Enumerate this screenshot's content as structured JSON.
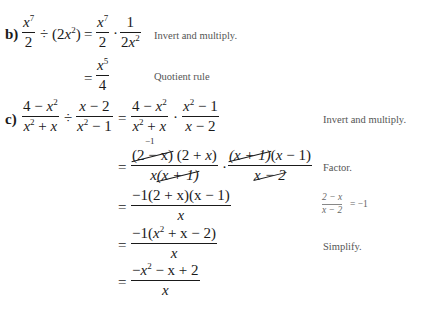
{
  "part_b": {
    "label": "b)",
    "line1": {
      "lhs_frac": {
        "num": "x",
        "num_exp": "7",
        "den": "2"
      },
      "divide_op": "÷",
      "divisor": {
        "open": "(2",
        "var": "x",
        "exp": "2",
        "close": ")"
      },
      "equals": "=",
      "rhs_frac1": {
        "num": "x",
        "num_exp": "7",
        "den": "2"
      },
      "dot": "·",
      "rhs_frac2": {
        "num": "1",
        "den_coef": "2",
        "den_var": "x",
        "den_exp": "2"
      },
      "note": "Invert and multiply."
    },
    "line2": {
      "equals": "=",
      "frac": {
        "num": "x",
        "num_exp": "5",
        "den": "4"
      },
      "note": "Quotient rule"
    }
  },
  "part_c": {
    "label": "c)",
    "line1": {
      "frac1": {
        "num_a": "4 − ",
        "num_var": "x",
        "num_exp": "2",
        "den_var1": "x",
        "den_exp": "2",
        "den_rest": " + ",
        "den_var2": "x"
      },
      "divide_op": "÷",
      "frac2": {
        "num_var": "x",
        "num_rest": " − 2",
        "den_var": "x",
        "den_exp": "2",
        "den_rest": " − 1"
      },
      "equals": "=",
      "frac3": {
        "num_a": "4 − ",
        "num_var": "x",
        "num_exp": "2",
        "den_var1": "x",
        "den_exp": "2",
        "den_rest": " + ",
        "den_var2": "x"
      },
      "dot": "·",
      "frac4": {
        "num_var": "x",
        "num_exp": "2",
        "num_rest": " − 1",
        "den_var": "x",
        "den_rest": " − 2"
      },
      "note": "Invert and multiply."
    },
    "line2": {
      "cancel_mark": "−1",
      "equals": "=",
      "frac1": {
        "num_p1": "(2 − x)",
        "num_p2": " (2 + ",
        "num_var": "x",
        "num_close": ")",
        "den_var": "x",
        "den_p": "(x + 1)"
      },
      "dot": "·",
      "frac2": {
        "num_p1": "(x + 1)",
        "num_p2": "(",
        "num_var": "x",
        "num_close": " − 1)",
        "den_p": "x − 2"
      },
      "note": "Factor."
    },
    "line3": {
      "equals": "=",
      "frac": {
        "num": "−1(2 + x)(x − 1)",
        "den": "x"
      },
      "side_note": {
        "num": "2 − x",
        "den": "x − 2",
        "result": "= −1"
      }
    },
    "line4": {
      "equals": "=",
      "frac": {
        "num_a": "−1(",
        "num_var": "x",
        "num_exp": "2",
        "num_rest": " + x − 2)",
        "den": "x"
      },
      "note": "Simplify."
    },
    "line5": {
      "equals": "=",
      "frac": {
        "num_a": "−",
        "num_var": "x",
        "num_exp": "2",
        "num_rest": " − x + 2",
        "den": "x"
      }
    }
  }
}
